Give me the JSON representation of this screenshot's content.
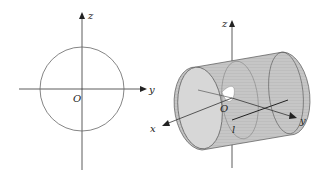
{
  "left_figure": {
    "axis_labels": {
      "z": "z",
      "y": "y",
      "origin": "O"
    },
    "shape": "circle"
  },
  "right_figure": {
    "axis_labels": {
      "z": "z",
      "y": "y",
      "x": "x",
      "origin": "O",
      "line": "l"
    },
    "shape": "cylinder"
  },
  "colors": {
    "stroke": "#555555",
    "surface": "#c9c9c9",
    "surface_dark": "#b5b5b5"
  }
}
